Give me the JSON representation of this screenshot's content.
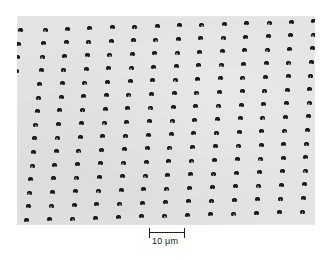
{
  "figure": {
    "type": "micrograph",
    "background_color": "#e3e3e3",
    "dot_color": "#1c1c1c"
  },
  "lattice": {
    "rows": 15,
    "columns": 13,
    "origin_x": 28,
    "origin_y": 13.5,
    "col_dx": 22.4,
    "col_dy": -0.7,
    "row_dx_left": -1.3,
    "row_dx_right": -0.8,
    "row_dy": 13.6,
    "partial_left_column": {
      "col_index": -1,
      "visible_rows": 5
    }
  },
  "scale_bar": {
    "label": "10 μm",
    "length_px": 36
  }
}
